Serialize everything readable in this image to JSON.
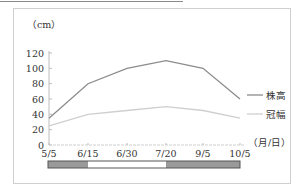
{
  "chart_data": {
    "type": "line",
    "title": "",
    "ylabel": "（cm）",
    "xlabel": "（月/日）",
    "ylim": [
      0,
      120
    ],
    "yticks": [
      0,
      20,
      40,
      60,
      80,
      100,
      120
    ],
    "categories": [
      "5/5",
      "6/15",
      "6/30",
      "7/20",
      "9/5",
      "10/5"
    ],
    "series": [
      {
        "name": "株高",
        "values": [
          35,
          80,
          100,
          110,
          100,
          60
        ],
        "color": "#8c8c8c"
      },
      {
        "name": "冠幅",
        "values": [
          25,
          40,
          45,
          50,
          45,
          35
        ],
        "color": "#cfcfcf"
      }
    ],
    "legend_position": "right",
    "grid": false,
    "period_bar": [
      {
        "from": "5/5",
        "to": "6/15",
        "fill": "#9a9a9a"
      },
      {
        "from": "6/15",
        "to": "7/20",
        "fill": "#ffffff"
      },
      {
        "from": "7/20",
        "to": "10/5",
        "fill": "#9a9a9a"
      }
    ]
  }
}
